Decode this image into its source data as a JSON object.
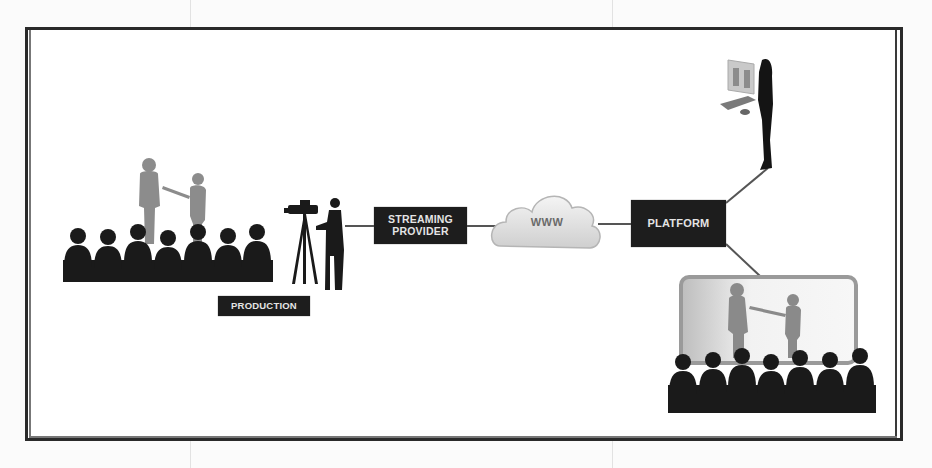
{
  "diagram": {
    "nodes": {
      "streaming_provider": {
        "line1": "STREAMING",
        "line2": "PROVIDER"
      },
      "www": {
        "label": "WWW"
      },
      "platform": {
        "label": "PLATFORM"
      },
      "production": {
        "label": "PRODUCTION"
      }
    },
    "groups": [
      {
        "id": "live-event",
        "description": "Presenters on stage with live audience"
      },
      {
        "id": "camera-crew",
        "description": "Camera operator filming the event"
      },
      {
        "id": "remote-viewer",
        "description": "Individual viewer at a computer"
      },
      {
        "id": "remote-audience",
        "description": "Group audience watching on a projection screen"
      }
    ],
    "edges": [
      {
        "from": "camera-crew",
        "to": "streaming_provider"
      },
      {
        "from": "streaming_provider",
        "to": "www"
      },
      {
        "from": "www",
        "to": "platform"
      },
      {
        "from": "platform",
        "to": "remote-viewer"
      },
      {
        "from": "platform",
        "to": "remote-audience"
      }
    ],
    "colors": {
      "node_fill": "#1d1d1d",
      "node_text": "#e4e4e4",
      "frame": "#2a2a2a",
      "silhouette": "#1a1a1a",
      "presenter": "#8c8c8c",
      "cloud": "#e6e6e6",
      "screen": "#9a9a9a"
    }
  }
}
